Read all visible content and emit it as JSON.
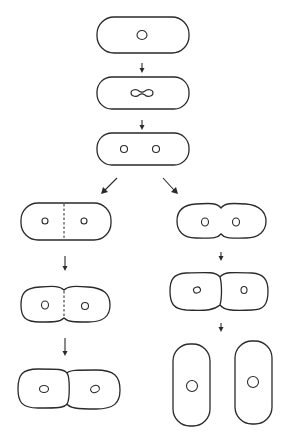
{
  "diagram": {
    "title": "",
    "stages": {
      "main": [
        {
          "id": "stage-1",
          "label": "",
          "state": "single cell, single nucleoid"
        },
        {
          "id": "stage-2",
          "label": "",
          "state": "nucleoid dividing (dumbbell shape)"
        },
        {
          "id": "stage-3",
          "label": "",
          "state": "two separated nucleoids"
        }
      ],
      "left_branch": [
        {
          "id": "left-1",
          "label": "",
          "state": "septum forming (dashed line)"
        },
        {
          "id": "left-2",
          "label": "",
          "state": "constriction with septum"
        },
        {
          "id": "left-3",
          "label": "",
          "state": "two daughter cells attached"
        }
      ],
      "right_branch": [
        {
          "id": "right-1",
          "label": "",
          "state": "constriction without septum"
        },
        {
          "id": "right-2",
          "label": "",
          "state": "two daughter cells joined"
        },
        {
          "id": "right-3",
          "label": "",
          "state": "two separated elongated daughter cells"
        }
      ]
    },
    "colors": {
      "stroke": "#2a2a2a",
      "background": "#ffffff"
    }
  }
}
